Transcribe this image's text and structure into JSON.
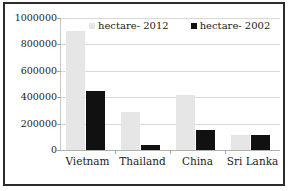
{
  "chart_data": {
    "type": "bar",
    "title": "",
    "xlabel": "",
    "ylabel": "",
    "ylim": [
      0,
      1000000
    ],
    "ytick_labels": [
      "1000000",
      "800000",
      "600000",
      "400000",
      "200000",
      "0"
    ],
    "ytick_values": [
      1000000,
      800000,
      600000,
      400000,
      200000,
      0
    ],
    "grid": true,
    "legend_position": "top-center",
    "categories": [
      "Vietnam",
      "Thailand",
      "China",
      "Sri Lanka"
    ],
    "series": [
      {
        "name": "hectare- 2012",
        "color": "#e6e6e6",
        "values": [
          905000,
          285000,
          420000,
          115000
        ]
      },
      {
        "name": "hectare- 2002",
        "color": "#111111",
        "values": [
          450000,
          40000,
          155000,
          115000
        ]
      }
    ]
  },
  "legend": {
    "entries": [
      {
        "label": "hectare- 2012"
      },
      {
        "label": "hectare- 2002"
      }
    ]
  }
}
